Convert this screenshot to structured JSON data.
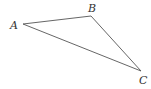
{
  "diagram": {
    "type": "triangle",
    "stroke_color": "#555555",
    "vertices": [
      {
        "name": "A",
        "x": 23,
        "y": 24,
        "label_x": 10,
        "label_y": 29
      },
      {
        "name": "B",
        "x": 91,
        "y": 16,
        "label_x": 88,
        "label_y": 12
      },
      {
        "name": "C",
        "x": 141,
        "y": 71,
        "label_x": 139,
        "label_y": 84
      }
    ],
    "labels": {
      "a": "A",
      "b": "B",
      "c": "C"
    }
  }
}
